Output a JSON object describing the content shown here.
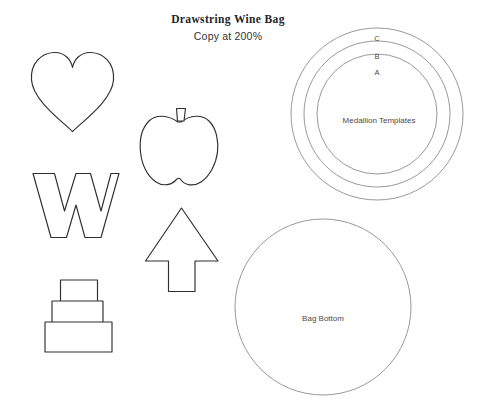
{
  "document": {
    "title": "Drawstring Wine Bag",
    "subtitle": "Copy at 200%",
    "background_color": "#ffffff",
    "ink_color": "#2f2f2f",
    "light_ink_color": "#8d8d8d"
  },
  "medallions": {
    "center_label": "Medallion Templates",
    "rings": [
      {
        "id": "C",
        "label": "C",
        "radius": 86
      },
      {
        "id": "B",
        "label": "B",
        "radius": 73
      },
      {
        "id": "A",
        "label": "A",
        "radius": 60
      }
    ]
  },
  "bag_bottom": {
    "label": "Bag Bottom"
  },
  "shapes": [
    {
      "name": "heart-template",
      "label": ""
    },
    {
      "name": "pumpkin-template",
      "label": ""
    },
    {
      "name": "letter-w-template",
      "label": ""
    },
    {
      "name": "tree-template",
      "label": ""
    },
    {
      "name": "cake-template",
      "label": ""
    }
  ]
}
